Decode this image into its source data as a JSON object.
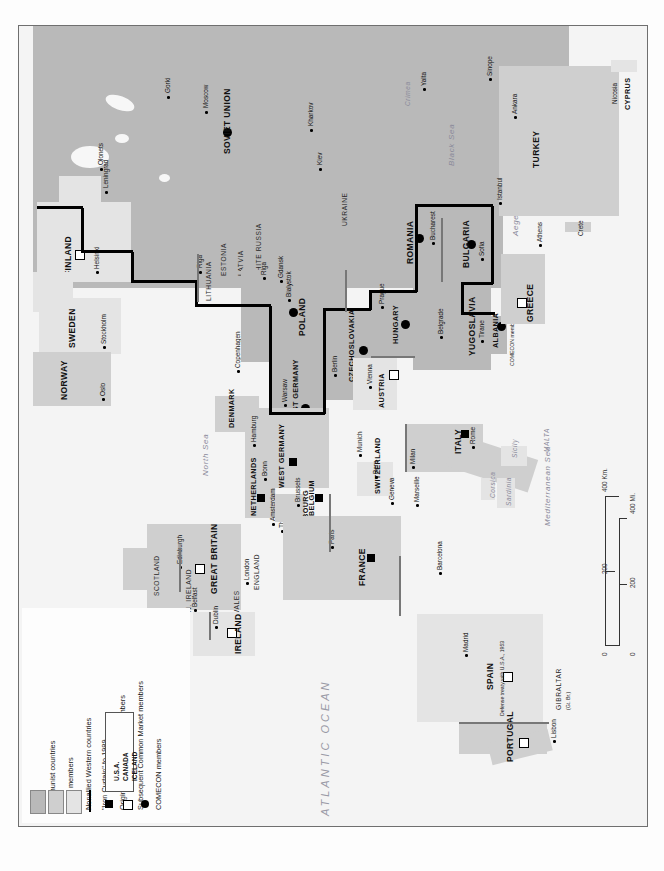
{
  "map": {
    "title": "Cold War Europe: Alliances and Economic Blocs",
    "ocean_label": "ATLANTIC OCEAN",
    "colors": {
      "communist": "#b9b9b9",
      "nato": "#cfcfcf",
      "nonallied": "#e4e4e4",
      "iron_curtain": "#000000",
      "sea": "#f4f4f4",
      "water_text": "#8a8a9a"
    }
  },
  "legend": {
    "entries": [
      {
        "label": "Communist countries",
        "symbol": "swatch-dark"
      },
      {
        "label": "NATO members",
        "symbol": "swatch-mid"
      },
      {
        "label": "Nonallied Western countries",
        "symbol": "swatch-light"
      },
      {
        "label": "\"Iron Curtain\" to 1989",
        "symbol": "thick-line"
      },
      {
        "label": "Original Common Market members",
        "symbol": "filled-square"
      },
      {
        "label": "Subsequent Common Market members",
        "symbol": "open-square"
      },
      {
        "label": "COMECON members",
        "symbol": "filled-circle"
      }
    ],
    "other_nato": {
      "title": "Other NATO members",
      "members": [
        "U.S.A.",
        "CANADA",
        "ICELAND"
      ]
    }
  },
  "scale": {
    "km_label": "400 Km.",
    "km_ticks": [
      "0",
      "200",
      "400"
    ],
    "mi_label": "400 Mi.",
    "mi_ticks": [
      "0",
      "200",
      "400"
    ]
  },
  "countries": [
    {
      "name": "SOVIET UNION",
      "bloc": "communist",
      "comecon": true
    },
    {
      "name": "FINLAND",
      "bloc": "nonallied",
      "common_market": "subsequent"
    },
    {
      "name": "SWEDEN",
      "bloc": "nonallied"
    },
    {
      "name": "NORWAY",
      "bloc": "nato"
    },
    {
      "name": "DENMARK",
      "bloc": "nato",
      "common_market": "subsequent"
    },
    {
      "name": "GREAT BRITAIN",
      "bloc": "nato",
      "common_market": "subsequent"
    },
    {
      "name": "IRELAND",
      "bloc": "nonallied",
      "common_market": "subsequent"
    },
    {
      "name": "NETHERLANDS",
      "bloc": "nato",
      "common_market": "original"
    },
    {
      "name": "BELGIUM",
      "bloc": "nato",
      "common_market": "original"
    },
    {
      "name": "LUXEMBOURG",
      "bloc": "nato",
      "common_market": "original"
    },
    {
      "name": "FRANCE",
      "bloc": "nato",
      "common_market": "original"
    },
    {
      "name": "WEST GERMANY",
      "bloc": "nato",
      "common_market": "original"
    },
    {
      "name": "EAST GERMANY",
      "bloc": "communist",
      "comecon": true
    },
    {
      "name": "POLAND",
      "bloc": "communist",
      "comecon": true
    },
    {
      "name": "CZECHOSLOVAKIA",
      "bloc": "communist",
      "comecon": true
    },
    {
      "name": "HUNGARY",
      "bloc": "communist",
      "comecon": true
    },
    {
      "name": "AUSTRIA",
      "bloc": "nonallied",
      "common_market": "subsequent"
    },
    {
      "name": "SWITZERLAND",
      "bloc": "nonallied"
    },
    {
      "name": "ITALY",
      "bloc": "nato",
      "common_market": "original"
    },
    {
      "name": "ROMANIA",
      "bloc": "communist",
      "comecon": true
    },
    {
      "name": "BULGARIA",
      "bloc": "communist",
      "comecon": true
    },
    {
      "name": "YUGOSLAVIA",
      "bloc": "communist"
    },
    {
      "name": "ALBANIA",
      "bloc": "communist",
      "comecon": true
    },
    {
      "name": "GREECE",
      "bloc": "nato",
      "common_market": "subsequent"
    },
    {
      "name": "TURKEY",
      "bloc": "nato"
    },
    {
      "name": "CYPRUS",
      "bloc": "nonallied"
    },
    {
      "name": "SPAIN",
      "bloc": "nonallied",
      "common_market": "subsequent"
    },
    {
      "name": "PORTUGAL",
      "bloc": "nato",
      "common_market": "subsequent"
    }
  ],
  "regions": [
    "ESTONIA",
    "LATVIA",
    "LITHUANIA",
    "WHITE RUSSIA",
    "UKRAINE",
    "SCOTLAND",
    "ENGLAND",
    "WALES",
    "N. IRELAND",
    "MALTA",
    "GIBRALTAR"
  ],
  "cities": [
    "Olonets",
    "Leningrad",
    "Gorki",
    "Moscow",
    "Kharkov",
    "Kiev",
    "Helsinki",
    "Stockholm",
    "Oslo",
    "Copenhagen",
    "Riga",
    "Gdansk",
    "Bialystok",
    "Warsaw",
    "Berlin",
    "Prague",
    "Vienna",
    "Budapest",
    "Belgrade",
    "Bucharest",
    "Sofia",
    "Tirane",
    "Istanbul",
    "Ankara",
    "Sinope",
    "Athens",
    "Crete",
    "Nicosia",
    "Hamburg",
    "Bonn",
    "Munich",
    "Bern",
    "Geneva",
    "Milan",
    "Marseille",
    "Rome",
    "Amsterdam",
    "The Hague",
    "Brussels",
    "Paris",
    "London",
    "Edinburgh",
    "Belfast",
    "Dublin",
    "Barcelona",
    "Madrid",
    "Lisbon"
  ],
  "waters": [
    "Black Sea",
    "Aegean Sea",
    "Mediterranean Sea",
    "North Sea",
    "Gulf of Finland",
    "Crimea",
    "Sicily",
    "Sardinia",
    "Corsica",
    "Yalta"
  ],
  "annotations": [
    {
      "text": "COMECON member, 1949-1961",
      "near": "ALBANIA"
    },
    {
      "text": "Defense treaty with U.S.A., 1953",
      "near": "SPAIN"
    },
    {
      "text": "(Gt. Br.)",
      "near": "GIBRALTAR"
    }
  ]
}
